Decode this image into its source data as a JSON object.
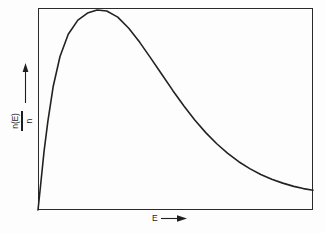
{
  "figure": {
    "background_color": "#fdfdfd",
    "line_color": "#222222",
    "frame_color": "#2a2a2a"
  },
  "axes": {
    "y": {
      "label_numerator": "n(E)",
      "label_denominator": "n",
      "arrow_icon": "up-arrow-icon",
      "direction": "up"
    },
    "x": {
      "label": "E",
      "arrow_icon": "right-arrow-icon",
      "direction": "right"
    }
  },
  "chart_data": {
    "type": "line",
    "title": "",
    "subtitle": "",
    "xlabel": "E",
    "ylabel": "n(E)/n",
    "grid": false,
    "legend": null,
    "axis_ticks": {
      "x": [],
      "y": []
    },
    "xlim": [
      0,
      1
    ],
    "ylim": [
      0,
      1
    ],
    "series": [
      {
        "name": "Maxwell-Boltzmann energy distribution",
        "x": [
          0.0,
          0.01,
          0.022,
          0.036,
          0.055,
          0.08,
          0.11,
          0.145,
          0.18,
          0.215,
          0.25,
          0.29,
          0.33,
          0.37,
          0.41,
          0.45,
          0.49,
          0.53,
          0.57,
          0.61,
          0.65,
          0.69,
          0.73,
          0.77,
          0.81,
          0.85,
          0.89,
          0.93,
          0.965,
          1.0
        ],
        "y": [
          0.0,
          0.13,
          0.29,
          0.44,
          0.61,
          0.76,
          0.87,
          0.94,
          0.975,
          0.99,
          0.985,
          0.955,
          0.9,
          0.83,
          0.752,
          0.672,
          0.592,
          0.516,
          0.446,
          0.383,
          0.328,
          0.28,
          0.239,
          0.205,
          0.176,
          0.152,
          0.133,
          0.117,
          0.106,
          0.098
        ]
      }
    ],
    "annotations": {
      "peak_x": 0.25,
      "peak_y": 0.99,
      "origin_value": 0.0,
      "tail_end_value": 0.098
    }
  }
}
